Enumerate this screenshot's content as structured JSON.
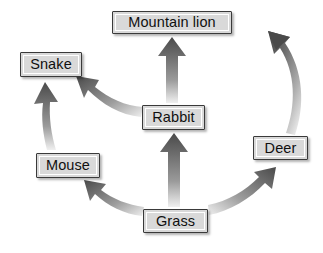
{
  "diagram": {
    "type": "food-web",
    "background_color": "#ffffff",
    "node_fill_color": "#d9d9d9",
    "node_border_color": "#3a3a3a",
    "arrow_color_dark": "#4a4a4a",
    "arrow_color_light": "#e8e8e8",
    "nodes": [
      {
        "id": "mountain-lion",
        "label": "Mountain lion"
      },
      {
        "id": "snake",
        "label": "Snake"
      },
      {
        "id": "rabbit",
        "label": "Rabbit"
      },
      {
        "id": "deer",
        "label": "Deer"
      },
      {
        "id": "mouse",
        "label": "Mouse"
      },
      {
        "id": "grass",
        "label": "Grass"
      }
    ],
    "arrows": [
      {
        "id": "grass-to-rabbit",
        "from": "Grass",
        "to": "Rabbit",
        "shape": "straight"
      },
      {
        "id": "rabbit-to-mountain-lion",
        "from": "Rabbit",
        "to": "Mountain lion",
        "shape": "straight"
      },
      {
        "id": "mouse-to-snake",
        "from": "Mouse",
        "to": "Snake",
        "shape": "curved"
      },
      {
        "id": "rabbit-to-snake",
        "from": "Rabbit",
        "to": "Snake",
        "shape": "curved"
      },
      {
        "id": "grass-to-mouse",
        "from": "Grass",
        "to": "Mouse",
        "shape": "curved"
      },
      {
        "id": "grass-to-deer",
        "from": "Grass",
        "to": "Deer",
        "shape": "curved"
      },
      {
        "id": "deer-to-mountain-lion",
        "from": "Deer",
        "to": "Mountain lion",
        "shape": "curved"
      }
    ]
  }
}
